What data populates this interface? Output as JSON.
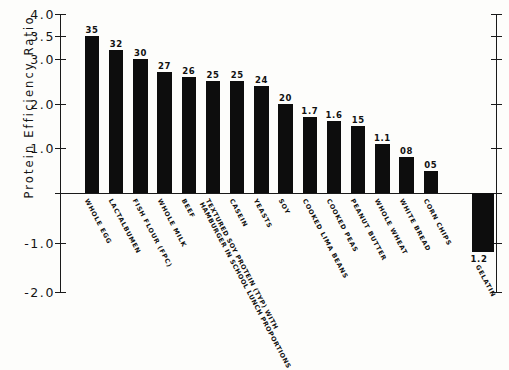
{
  "chart_data": {
    "type": "bar",
    "title": "",
    "xlabel": "",
    "ylabel": "Protein Efficiency Ratio",
    "ylim": [
      -2.0,
      4.0
    ],
    "grid": false,
    "legend": null,
    "y_ticks": [
      {
        "value": 4.0,
        "label": "4.0"
      },
      {
        "value": 3.5,
        "label": "3.5"
      },
      {
        "value": 3.0,
        "label": "3.0"
      },
      {
        "value": 2.0,
        "label": "2.0"
      },
      {
        "value": 1.0,
        "label": "1.0"
      },
      {
        "value": 0.0,
        "label": ""
      },
      {
        "value": -1.0,
        "label": "-1.0"
      },
      {
        "value": -2.0,
        "label": "-2.0"
      }
    ],
    "categories": [
      "WHOLE EGG",
      "LACTALBUMEN",
      "FISH FLOUR (FPC)",
      "WHOLE MILK",
      "BEEF",
      "TEXTURED SOY PROTEIN (TYP) WITH HAMBURGER IN SCHOOL LUNCH PROPORTIONS",
      "CASEIN",
      "YEASTS",
      "SOY",
      "COOKED LIMA BEANS",
      "COOKED PEAS",
      "PEANUT BUTTER",
      "WHOLE WHEAT",
      "WHITE BREAD",
      "CORN CHIPS",
      "GELATIN"
    ],
    "category_lines": [
      [
        "WHOLE EGG"
      ],
      [
        "LACTALBUMEN"
      ],
      [
        "FISH FLOUR (FPC)"
      ],
      [
        "WHOLE MILK"
      ],
      [
        "BEEF"
      ],
      [
        "TEXTURED SOY PROTEIN (TYP) WITH",
        "HAMBURGER IN SCHOOL LUNCH PROPORTIONS"
      ],
      [
        "CASEIN"
      ],
      [
        "YEASTS"
      ],
      [
        "SOY"
      ],
      [
        "COOKED LIMA BEANS"
      ],
      [
        "COOKED PEAS"
      ],
      [
        "PEANUT BUTTER"
      ],
      [
        "WHOLE WHEAT"
      ],
      [
        "WHITE BREAD"
      ],
      [
        "CORN CHIPS"
      ],
      [
        "GELATIN"
      ]
    ],
    "values": [
      3.5,
      3.2,
      3.0,
      2.7,
      2.6,
      2.5,
      2.5,
      2.4,
      2.0,
      1.7,
      1.6,
      1.5,
      1.1,
      0.8,
      0.5,
      -1.2
    ],
    "value_labels": [
      "35",
      "32",
      "30",
      "27",
      "26",
      "25",
      "25",
      "24",
      "20",
      "1.7",
      "1.6",
      "15",
      "1.1",
      "08",
      "05",
      "1.2"
    ],
    "bar_color": "#0d0d0d",
    "axis_color": "#1a1a1a",
    "background_color": "#fdfdfb"
  }
}
